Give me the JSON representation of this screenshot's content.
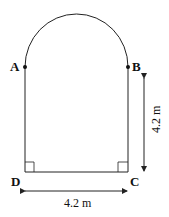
{
  "diagram": {
    "points": {
      "A": "A",
      "B": "B",
      "C": "C",
      "D": "D"
    },
    "dimensions": {
      "height": "4.2 m",
      "width": "4.2 m"
    },
    "colors": {
      "stroke": "#222222",
      "background": "#ffffff"
    }
  }
}
